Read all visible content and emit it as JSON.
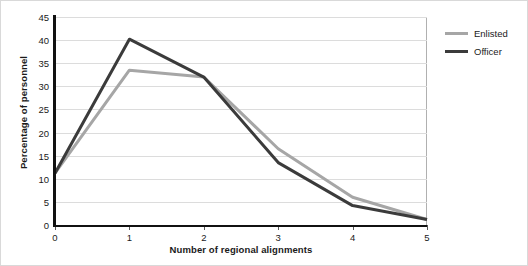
{
  "chart_data": {
    "type": "line",
    "title": "",
    "xlabel": "Number of regional alignments",
    "ylabel": "Percentage of personnel",
    "x": [
      0,
      1,
      2,
      3,
      4,
      5
    ],
    "categories": [
      "0",
      "1",
      "2",
      "3",
      "4",
      "5"
    ],
    "xlim": [
      0,
      5
    ],
    "ylim": [
      0,
      45
    ],
    "yticks": [
      0,
      5,
      10,
      15,
      20,
      25,
      30,
      35,
      40,
      45
    ],
    "ytick_labels": [
      "0",
      "5",
      "10",
      "15",
      "20",
      "25",
      "30",
      "35",
      "40",
      "45"
    ],
    "grid": "horizontal",
    "legend_position": "right-outside",
    "series": [
      {
        "name": "Enlisted",
        "color": "#a6a6a6",
        "values": [
          11.2,
          33.5,
          32.0,
          16.5,
          6.0,
          1.2
        ]
      },
      {
        "name": "Officer",
        "color": "#3b3b3b",
        "values": [
          11.2,
          40.2,
          32.0,
          13.5,
          4.2,
          1.2
        ]
      }
    ]
  },
  "legend": {
    "items": [
      {
        "label": "Enlisted",
        "color": "#a6a6a6"
      },
      {
        "label": "Officer",
        "color": "#3b3b3b"
      }
    ]
  },
  "colors": {
    "background": "#ffffff",
    "axis": "#111111",
    "gridline": "#dcdcdc",
    "frame": "#b0b0b0",
    "text": "#1a1a1a",
    "enlisted": "#a6a6a6",
    "officer": "#3b3b3b"
  }
}
